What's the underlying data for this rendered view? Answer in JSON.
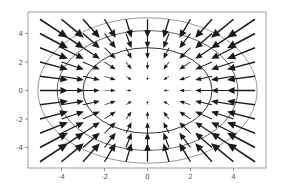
{
  "chart_data": {
    "type": "quiver",
    "title": "",
    "xlabel": "",
    "ylabel": "",
    "xlim": [
      -5.5,
      5.5
    ],
    "ylim": [
      -5.5,
      5.5
    ],
    "grid": false,
    "legend": null,
    "x_ticks": [
      -4,
      -2,
      0,
      2,
      4
    ],
    "y_ticks": [
      4,
      2,
      0,
      -2,
      -4
    ],
    "x_tick_labels": [
      "-4",
      "-2",
      "0",
      "2",
      "4"
    ],
    "y_tick_labels": [
      "4",
      "2",
      "0",
      "-2",
      "-4"
    ],
    "quiver": {
      "grid_x": [
        -5,
        -4,
        -3,
        -2,
        -1,
        0,
        1,
        2,
        3,
        4,
        5
      ],
      "grid_y": [
        -5,
        -4,
        -3,
        -2,
        -1,
        0,
        1,
        2,
        3,
        4,
        5
      ],
      "vector_field": "U = -x, V = -y (arrows point toward origin, length grows with distance)",
      "color": "#1a1a1a"
    },
    "contours": [
      {
        "level": "r=3",
        "radius": 3.0,
        "color": "#333333"
      },
      {
        "level": "r=4",
        "radius": 4.2,
        "color": "#666666"
      },
      {
        "level": "r=5",
        "radius": 5.1,
        "color": "#999999"
      }
    ]
  },
  "axes": {
    "frame_color": "#888888",
    "px": {
      "left": 28,
      "right": 266,
      "top": 12,
      "bottom": 168
    }
  }
}
